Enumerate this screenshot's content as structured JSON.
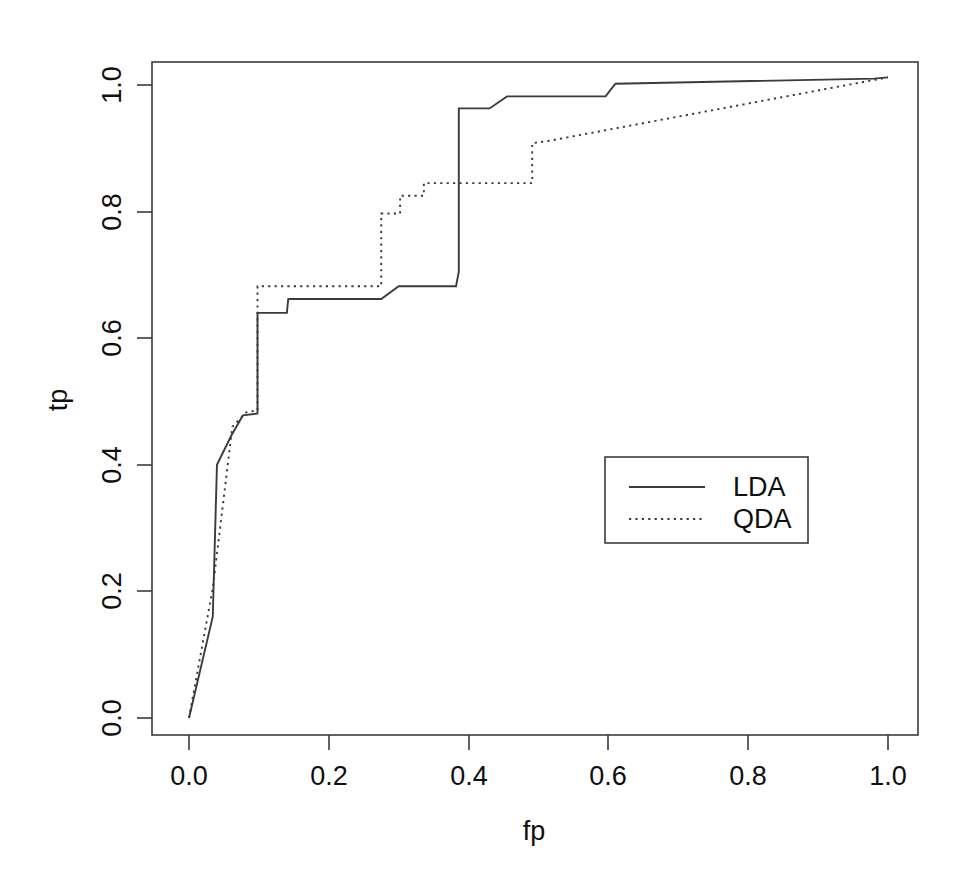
{
  "chart_data": {
    "type": "line",
    "title": "",
    "xlabel": "fp",
    "ylabel": "tp",
    "xlim": [
      0.0,
      1.0
    ],
    "ylim": [
      0.0,
      1.0
    ],
    "grid": false,
    "legend_position": "center-right",
    "xticks": [
      "0.0",
      "0.2",
      "0.4",
      "0.6",
      "0.8",
      "1.0"
    ],
    "xtick_values": [
      0.0,
      0.2,
      0.4,
      0.6,
      0.8,
      1.0
    ],
    "yticks": [
      "0.0",
      "0.2",
      "0.4",
      "0.6",
      "0.8",
      "1.0"
    ],
    "ytick_values": [
      0.0,
      0.2,
      0.4,
      0.6,
      0.8,
      1.0
    ],
    "series": [
      {
        "name": "LDA",
        "style": "solid",
        "color": "#3b3b3b",
        "points": [
          [
            0.0,
            0.0
          ],
          [
            0.034,
            0.16
          ],
          [
            0.04,
            0.4
          ],
          [
            0.06,
            0.445
          ],
          [
            0.077,
            0.478
          ],
          [
            0.098,
            0.481
          ],
          [
            0.098,
            0.64
          ],
          [
            0.14,
            0.64
          ],
          [
            0.142,
            0.662
          ],
          [
            0.275,
            0.662
          ],
          [
            0.3,
            0.682
          ],
          [
            0.382,
            0.682
          ],
          [
            0.386,
            0.705
          ],
          [
            0.386,
            0.963
          ],
          [
            0.43,
            0.963
          ],
          [
            0.455,
            0.982
          ],
          [
            0.596,
            0.982
          ],
          [
            0.61,
            1.002
          ],
          [
            0.98,
            1.01
          ],
          [
            1.0,
            1.012
          ]
        ]
      },
      {
        "name": "QDA",
        "style": "dotted",
        "color": "#3b3b3b",
        "points": [
          [
            0.0,
            0.0
          ],
          [
            0.034,
            0.205
          ],
          [
            0.062,
            0.46
          ],
          [
            0.082,
            0.483
          ],
          [
            0.098,
            0.486
          ],
          [
            0.098,
            0.682
          ],
          [
            0.275,
            0.682
          ],
          [
            0.275,
            0.797
          ],
          [
            0.302,
            0.797
          ],
          [
            0.302,
            0.825
          ],
          [
            0.336,
            0.825
          ],
          [
            0.336,
            0.845
          ],
          [
            0.491,
            0.845
          ],
          [
            0.491,
            0.908
          ],
          [
            0.516,
            0.912
          ],
          [
            0.98,
            1.008
          ],
          [
            1.0,
            1.012
          ]
        ]
      }
    ]
  },
  "legend": {
    "entries": [
      {
        "label": "LDA",
        "style": "solid"
      },
      {
        "label": "QDA",
        "style": "dotted"
      }
    ]
  },
  "axes": {
    "x_title": "fp",
    "y_title": "tp"
  }
}
